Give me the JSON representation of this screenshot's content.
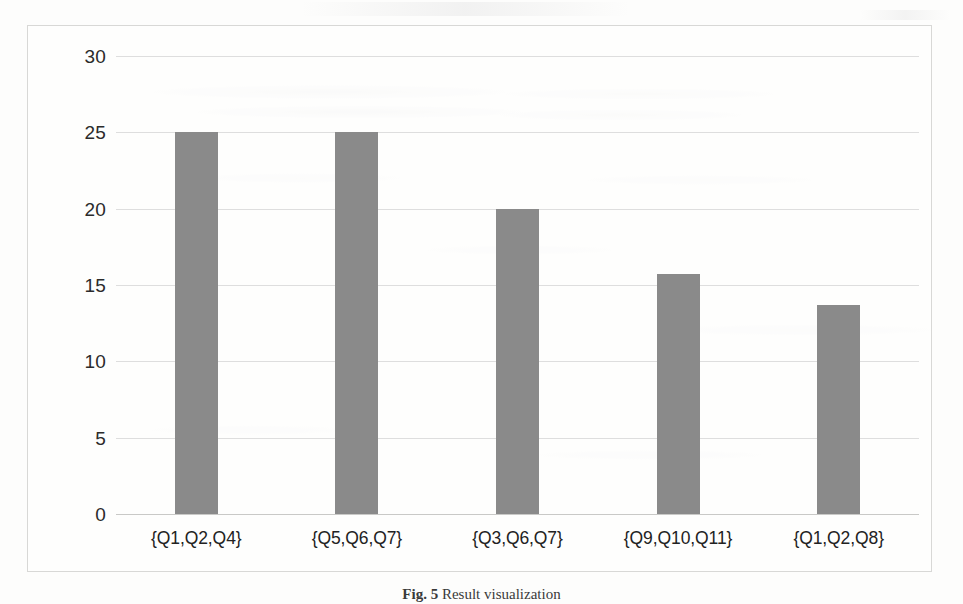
{
  "figure": {
    "caption_label": "Fig. 5",
    "caption_text": "Result visualization"
  },
  "chart_data": {
    "type": "bar",
    "title": "",
    "xlabel": "",
    "ylabel": "",
    "categories": [
      "{Q1,Q2,Q4}",
      "{Q5,Q6,Q7}",
      "{Q3,Q6,Q7}",
      "{Q9,Q10,Q11}",
      "{Q1,Q2,Q8}"
    ],
    "values": [
      25,
      25,
      20,
      15.7,
      13.7
    ],
    "ylim": [
      0,
      30
    ],
    "ytick_step": 5,
    "yticks": [
      "30",
      "25",
      "20",
      "15",
      "10",
      "5",
      "0"
    ],
    "ytick_values": [
      30,
      25,
      20,
      15,
      10,
      5,
      0
    ],
    "grid": true,
    "legend": "none",
    "bar_color": "#8a8a8a",
    "grid_color": "#dedede",
    "frame_color": "#d8d8d6",
    "background_color": "#ffffff"
  }
}
